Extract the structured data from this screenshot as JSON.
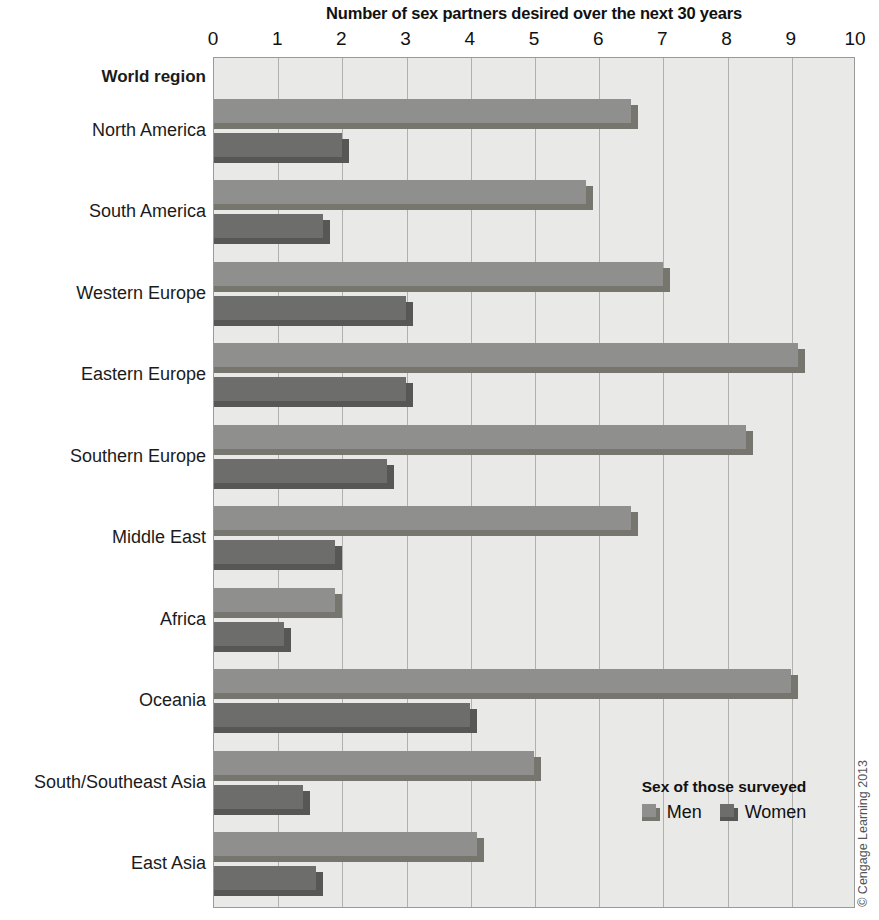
{
  "chart_data": {
    "type": "bar",
    "orientation": "horizontal",
    "title": "Number of sex partners desired over the next 30 years",
    "xlabel": "",
    "ylabel": "World region",
    "xlim": [
      0,
      10
    ],
    "xticks": [
      "0",
      "1",
      "2",
      "3",
      "4",
      "5",
      "6",
      "7",
      "8",
      "9",
      "10"
    ],
    "grid": true,
    "legend_position": "inside-bottom-right",
    "categories": [
      "North America",
      "South America",
      "Western Europe",
      "Eastern Europe",
      "Southern Europe",
      "Middle East",
      "Africa",
      "Oceania",
      "South/Southeast Asia",
      "East Asia"
    ],
    "series": [
      {
        "name": "Men",
        "color": "#8f8f8d",
        "values": [
          6.6,
          5.9,
          7.1,
          9.2,
          8.4,
          6.6,
          2.0,
          9.1,
          5.1,
          4.2
        ]
      },
      {
        "name": "Women",
        "color": "#6d6d6b",
        "values": [
          2.1,
          1.8,
          3.1,
          3.1,
          2.8,
          2.0,
          1.2,
          4.1,
          1.5,
          1.7
        ]
      }
    ]
  },
  "legend": {
    "title": "Sex of those surveyed",
    "entries": [
      "Men",
      "Women"
    ]
  },
  "axis": {
    "category_header": "World region"
  },
  "credit": "© Cengage Learning 2013"
}
